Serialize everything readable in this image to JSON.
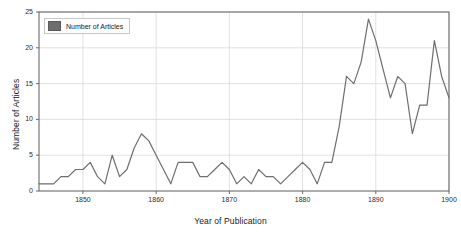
{
  "chart_data": {
    "type": "line",
    "title": "",
    "xlabel": "Year of Publication",
    "ylabel": "Number of Articles",
    "legend": [
      {
        "name": "Number of Articles",
        "color": "#6e6e6e"
      }
    ],
    "legend_position": "top-left",
    "grid": true,
    "xlim": [
      1844,
      1900
    ],
    "ylim": [
      0,
      25
    ],
    "yticks": [
      0,
      5,
      10,
      15,
      20,
      25
    ],
    "ytick_labels": [
      "0",
      "5",
      "10",
      "15",
      "20",
      "25"
    ],
    "xticks": [
      1850,
      1860,
      1870,
      1880,
      1890,
      1900
    ],
    "xtick_labels": [
      "1850",
      "1860",
      "1870",
      "1880",
      "1890",
      "1900"
    ],
    "series": [
      {
        "name": "Number of Articles",
        "color": "#6e6e6e",
        "x": [
          1844,
          1845,
          1846,
          1847,
          1848,
          1849,
          1850,
          1851,
          1852,
          1853,
          1854,
          1855,
          1856,
          1857,
          1858,
          1859,
          1860,
          1861,
          1862,
          1863,
          1864,
          1865,
          1866,
          1867,
          1868,
          1869,
          1870,
          1871,
          1872,
          1873,
          1874,
          1875,
          1876,
          1877,
          1878,
          1879,
          1880,
          1881,
          1882,
          1883,
          1884,
          1885,
          1886,
          1887,
          1888,
          1889,
          1890,
          1891,
          1892,
          1893,
          1894,
          1895,
          1896,
          1897,
          1898,
          1899,
          1900
        ],
        "values": [
          1,
          1,
          1,
          2,
          2,
          3,
          3,
          4,
          2,
          1,
          5,
          2,
          3,
          6,
          8,
          7,
          5,
          3,
          1,
          4,
          4,
          4,
          2,
          2,
          3,
          4,
          3,
          1,
          2,
          1,
          3,
          2,
          2,
          1,
          2,
          3,
          4,
          3,
          1,
          4,
          4,
          9,
          16,
          15,
          18,
          24,
          21,
          17,
          13,
          16,
          15,
          8,
          12,
          12,
          21,
          16,
          13
        ]
      }
    ]
  },
  "legend": {
    "entry_label": "Number of Articles"
  },
  "axes": {
    "x_title": "Year of Publication",
    "y_title": "Number of Articles"
  }
}
